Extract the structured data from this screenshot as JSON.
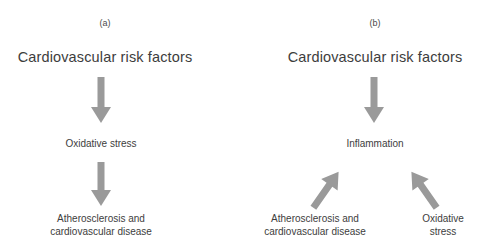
{
  "figure": {
    "background_color": "#ffffff",
    "text_color": "#3d3d3d",
    "arrow_color": "#9a9a9a"
  },
  "panels": [
    {
      "id": "a",
      "label": "(a)",
      "nodes": {
        "root": "Cardiovascular risk factors",
        "middle": "Oxidative stress",
        "leaf1": "Atherosclerosis and\ncardiovascular disease"
      }
    },
    {
      "id": "b",
      "label": "(b)",
      "nodes": {
        "root": "Cardiovascular risk factors",
        "middle": "Inflammation",
        "leaf1": "Atherosclerosis and\ncardiovascular disease",
        "leaf2": "Oxidative\nstress"
      }
    }
  ]
}
